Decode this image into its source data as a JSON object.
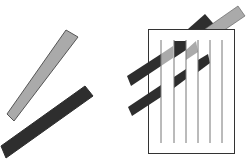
{
  "canvas": {
    "width": 246,
    "height": 162,
    "background": "#ffffff"
  },
  "colors": {
    "gray_fill": "#aaaaaa",
    "gray_stroke": "#555555",
    "dark_fill": "#2e2e2e",
    "frame_stroke": "#333333",
    "line_stroke": "#777777"
  },
  "left_group": {
    "gray_bar": {
      "points": "66,30 78,37 14,121 7,114"
    },
    "dark_bar": {
      "points": "85,86 93,96 6,158 1,146"
    }
  },
  "right_group": {
    "back_bands": [
      {
        "name": "upper-dark-band-top",
        "points": "188,29 205,14 219,30 203,39"
      },
      {
        "name": "upper-gray-band-top",
        "points": "205,29 238,6 245,16 220,33"
      }
    ],
    "frame": {
      "x": 148.5,
      "y": 29.5,
      "width": 86,
      "height": 124
    },
    "vertical_lines_x": [
      161,
      174,
      186,
      198,
      210,
      222
    ],
    "vertical_lines_y": [
      40,
      143
    ],
    "front_segments": [
      {
        "name": "upper-band-left-dark",
        "fill": "dark",
        "points": "127,76 161,54 161,66 131,86"
      },
      {
        "name": "upper-band-gray-1",
        "fill": "gray",
        "points": "161,54 173,46 173,58 161,66"
      },
      {
        "name": "upper-band-dark-col",
        "fill": "dark",
        "points": "174,41 186,41 186,50 174,58"
      },
      {
        "name": "upper-band-gray-2",
        "fill": "gray",
        "points": "186,50 196,41 198,52 186,60"
      },
      {
        "name": "lower-band-left-dark",
        "fill": "dark",
        "points": "128,107 161,85 161,97 132,116"
      },
      {
        "name": "lower-band-dark-col",
        "fill": "dark",
        "points": "174,77 186,69 186,79 174,88"
      },
      {
        "name": "lower-band-right-dark",
        "fill": "dark",
        "points": "198,60 208,54 210,63 198,72"
      }
    ]
  }
}
